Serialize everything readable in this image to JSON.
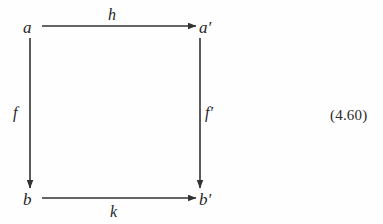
{
  "figure": {
    "kind": "commutative-diagram",
    "equation_number": "(4.60)",
    "stroke_color": "#323232",
    "text_color": "#262626",
    "background_color": "#fefefe"
  },
  "nodes": [
    {
      "id": "a",
      "label": "a",
      "x": 30,
      "y": 26
    },
    {
      "id": "ap",
      "label": "a′",
      "x": 200,
      "y": 26
    },
    {
      "id": "b",
      "label": "b",
      "x": 30,
      "y": 198
    },
    {
      "id": "bp",
      "label": "b′",
      "x": 200,
      "y": 198
    }
  ],
  "edges": [
    {
      "id": "h",
      "label": "h",
      "from": "a",
      "to": "ap",
      "direction": "right"
    },
    {
      "id": "k",
      "label": "k",
      "from": "b",
      "to": "bp",
      "direction": "right"
    },
    {
      "id": "f",
      "label": "f",
      "from": "a",
      "to": "b",
      "direction": "down"
    },
    {
      "id": "fp",
      "label": "f′",
      "from": "ap",
      "to": "bp",
      "direction": "down"
    }
  ]
}
